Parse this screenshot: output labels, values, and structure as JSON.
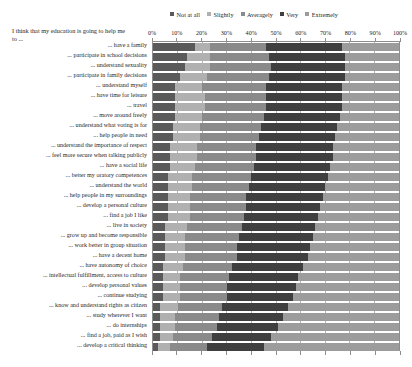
{
  "y_axis_title": "I think that my education is going to help me to ...",
  "legend": {
    "position": "top-right",
    "entries": [
      {
        "label": "Not at all",
        "color": "#5a5a5a"
      },
      {
        "label": "Slightly",
        "color": "#b0b0b0"
      },
      {
        "label": "Averagely",
        "color": "#8a8a8a"
      },
      {
        "label": "Very",
        "color": "#3f3f3f"
      },
      {
        "label": "Extremely",
        "color": "#9c9c9c"
      }
    ]
  },
  "chart_data": {
    "type": "bar",
    "subtype": "stacked-horizontal-100pct",
    "title": "I think that my education is going to help me to ...",
    "xlabel": "",
    "ylabel": "I think that my education is going to help me to ...",
    "xlim": [
      0,
      100
    ],
    "grid": true,
    "xtick_labels": [
      "0%",
      "10%",
      "20%",
      "30%",
      "40%",
      "50%",
      "60%",
      "70%",
      "80%",
      "90%",
      "100%"
    ],
    "xtick_values": [
      0,
      10,
      20,
      30,
      40,
      50,
      60,
      70,
      80,
      90,
      100
    ],
    "legend_position": "top-right",
    "categories": [
      "... have a family",
      "... participate in school decisions",
      "... understand sexuality",
      "... participate in family decisions",
      "... understand myself",
      "... have time for leisure",
      "... travel",
      "... move around freely",
      "... understand what voting is for",
      "... help people in need",
      "... understand the importance of respect",
      "... feel more secure when talking publicly",
      "... have a social life",
      "... better my oratory competences",
      "... understand the world",
      "... help people in my surroundings",
      "... develop a personal culture",
      "... find a job I like",
      "... live in society",
      "... grow up and become responsible",
      "... work better in group situation",
      "... have a decent home",
      "... have autonomy of choice",
      "... intellectual fulfillment, access to culture",
      "... develop personal values",
      "... continue studying",
      "... know and understand rights as citizen",
      "... study wherever I want",
      "... do internships",
      "... find a job, paid as I wish",
      "... develop a critical thinking"
    ],
    "series": [
      {
        "name": "Not at all",
        "color": "#5a5a5a",
        "values": [
          17,
          14,
          13,
          11,
          9,
          9,
          9,
          9,
          8,
          8,
          7,
          7,
          7,
          6,
          6,
          6,
          6,
          6,
          5,
          5,
          5,
          5,
          4,
          4,
          4,
          4,
          3,
          3,
          3,
          3,
          2
        ]
      },
      {
        "name": "Slightly",
        "color": "#b0b0b0",
        "values": [
          6,
          9,
          10,
          11,
          11,
          12,
          12,
          11,
          11,
          11,
          11,
          11,
          10,
          10,
          10,
          9,
          9,
          9,
          9,
          8,
          8,
          8,
          8,
          7,
          7,
          7,
          7,
          6,
          6,
          5,
          5
        ]
      },
      {
        "name": "Averagely",
        "color": "#8a8a8a",
        "values": [
          23,
          24,
          25,
          25,
          26,
          25,
          25,
          25,
          25,
          24,
          24,
          24,
          24,
          24,
          23,
          23,
          23,
          22,
          22,
          22,
          21,
          21,
          20,
          20,
          19,
          19,
          18,
          18,
          17,
          16,
          15
        ]
      },
      {
        "name": "Very",
        "color": "#3f3f3f",
        "values": [
          31,
          31,
          30,
          31,
          31,
          31,
          31,
          31,
          31,
          31,
          31,
          31,
          31,
          31,
          31,
          31,
          30,
          30,
          30,
          30,
          30,
          29,
          29,
          28,
          28,
          27,
          27,
          26,
          25,
          24,
          23
        ]
      },
      {
        "name": "Extremely",
        "color": "#9c9c9c",
        "values": [
          23,
          22,
          22,
          22,
          23,
          23,
          23,
          24,
          25,
          26,
          27,
          27,
          28,
          29,
          30,
          31,
          32,
          33,
          34,
          35,
          36,
          37,
          39,
          41,
          42,
          43,
          45,
          47,
          49,
          52,
          55
        ]
      }
    ]
  }
}
